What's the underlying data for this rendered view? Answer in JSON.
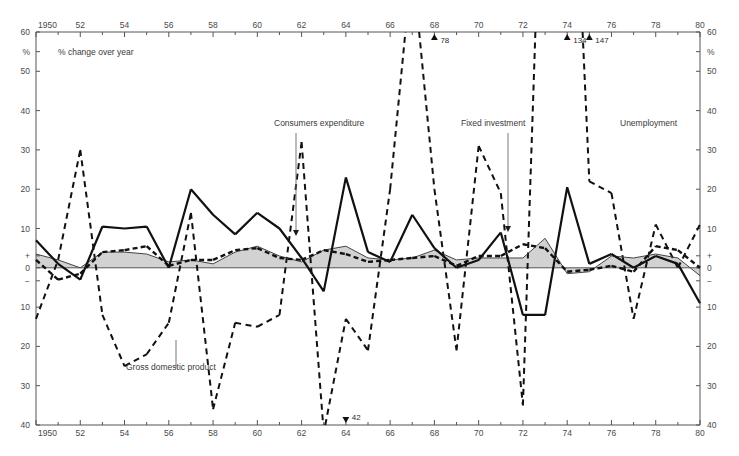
{
  "meta": {
    "top_partial_title": "",
    "subtitle": "% change over year",
    "percent_symbol": "%"
  },
  "colors": {
    "axis": "#555555",
    "gdp_line": "#444444",
    "gdp_fill": "#d0d0d0",
    "consumers": "#111111",
    "fixed_investment": "#111111",
    "unemployment": "#111111",
    "text": "#3a3a3a"
  },
  "annotations": {
    "gdp": "Gross domestic product",
    "consumers": "Consumers expenditure",
    "fixed_investment": "Fixed investment",
    "unemployment": "Unemployment"
  },
  "offscale_values": [
    {
      "label": "78",
      "year": 1968,
      "direction": "up"
    },
    {
      "label": "134",
      "year": 1974,
      "direction": "up"
    },
    {
      "label": "147",
      "year": 1975,
      "direction": "up"
    },
    {
      "label": "42",
      "year": 1964,
      "direction": "down"
    }
  ],
  "chart_data": {
    "type": "line",
    "title": "",
    "subtitle": "% change over year",
    "xlabel": "",
    "ylabel": "%",
    "xlim": [
      1950,
      1980
    ],
    "ylim": [
      -40,
      60
    ],
    "grid": false,
    "legend": "annotated-inline",
    "yticks": [
      60,
      50,
      40,
      30,
      20,
      10,
      0,
      -10,
      -20,
      -30,
      -40
    ],
    "ytick_labels": [
      "60",
      "50",
      "40",
      "30",
      "20",
      "10",
      "0",
      "10",
      "20",
      "30",
      "40"
    ],
    "ytick_plus": "+",
    "ytick_minus": "−",
    "xticks": [
      1950,
      1952,
      1954,
      1956,
      1958,
      1960,
      1962,
      1964,
      1966,
      1968,
      1970,
      1972,
      1974,
      1976,
      1978,
      1980
    ],
    "xtick_labels": [
      "1950",
      "52",
      "54",
      "56",
      "58",
      "60",
      "62",
      "64",
      "66",
      "68",
      "70",
      "72",
      "74",
      "76",
      "78",
      "80"
    ],
    "x": [
      1950,
      1951,
      1952,
      1953,
      1954,
      1955,
      1956,
      1957,
      1958,
      1959,
      1960,
      1961,
      1962,
      1963,
      1964,
      1965,
      1966,
      1967,
      1968,
      1969,
      1970,
      1971,
      1972,
      1973,
      1974,
      1975,
      1976,
      1977,
      1978,
      1979,
      1980
    ],
    "series": [
      {
        "name": "Gross domestic product",
        "style": "thin-solid-filled",
        "values": [
          3.5,
          2.0,
          0.0,
          4.0,
          4.0,
          3.5,
          1.5,
          2.0,
          1.0,
          4.0,
          5.5,
          3.0,
          1.5,
          4.5,
          5.5,
          2.5,
          2.0,
          2.5,
          4.5,
          2.0,
          2.5,
          2.5,
          2.5,
          7.5,
          -1.5,
          -1.0,
          3.0,
          2.5,
          3.5,
          2.5,
          -2.0
        ]
      },
      {
        "name": "Consumers expenditure",
        "style": "thick-dashed",
        "values": [
          2.0,
          -3.0,
          -1.5,
          4.0,
          4.5,
          5.5,
          0.5,
          2.0,
          2.0,
          4.5,
          5.0,
          2.5,
          2.0,
          4.5,
          3.5,
          1.5,
          2.0,
          2.5,
          3.0,
          0.5,
          3.0,
          3.0,
          6.0,
          5.0,
          -1.0,
          -0.5,
          0.5,
          -1.0,
          5.5,
          4.5,
          0.0
        ]
      },
      {
        "name": "Fixed investment",
        "style": "thick-solid",
        "values": [
          7.0,
          1.0,
          -3.0,
          10.5,
          10.0,
          10.5,
          0.0,
          20.0,
          13.5,
          8.5,
          14.0,
          10.0,
          2.5,
          -6.0,
          23.0,
          4.0,
          1.5,
          13.5,
          5.0,
          0.0,
          2.0,
          9.0,
          -12.0,
          -12.0,
          20.5,
          1.0,
          3.5,
          0.0,
          3.0,
          1.0,
          -9.0
        ]
      },
      {
        "name": "Unemployment",
        "style": "long-dashed",
        "values": [
          -13.0,
          2.0,
          30.0,
          -12.0,
          -25.0,
          -22.0,
          -14.0,
          14.0,
          -36.0,
          -14.0,
          -15.0,
          -12.0,
          32.0,
          -42.0,
          -13.0,
          -21.0,
          20.0,
          78.0,
          20.0,
          -21.0,
          31.0,
          19.0,
          -35.0,
          134.0,
          147.0,
          22.0,
          19.0,
          -13.0,
          11.0,
          0.0,
          11.0
        ]
      }
    ]
  }
}
